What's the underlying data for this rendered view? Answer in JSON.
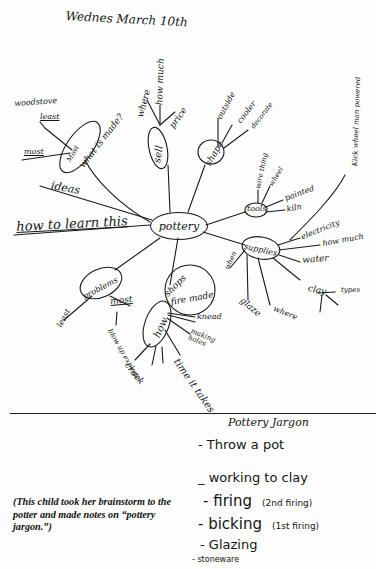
{
  "header": {
    "date": "Wednes March 10th"
  },
  "mindmap": {
    "center": "pottery",
    "branches": {
      "what_is_made": {
        "label": "what is made?",
        "sub_label": "Most",
        "children": [
          "woodstove",
          "least",
          "most"
        ]
      },
      "ideas": {
        "label": "ideas"
      },
      "how_to_learn": {
        "label": "how to learn this"
      },
      "sell": {
        "label": "sell",
        "children": [
          "where",
          "how much",
          "price"
        ]
      },
      "shape": {
        "label": "shape",
        "children": [
          "outside",
          "cooler",
          "decorate"
        ]
      },
      "tools": {
        "label": "tools",
        "children": [
          "wire thing",
          "wheel",
          "painted",
          "kiln"
        ]
      },
      "supplies": {
        "label": "supplies",
        "side": "when",
        "children": [
          "electricity",
          "how much",
          "water",
          "clay",
          "glaze",
          "where"
        ],
        "clay_child": "types",
        "electricity_note": "Kick wheel man powered"
      },
      "problems": {
        "label": "problems",
        "children": [
          "least",
          "most"
        ],
        "most_child": "blow up explode"
      },
      "how": {
        "label": "how",
        "shops_label": "shops",
        "fire_label": "fire made",
        "children": [
          "knead",
          "making holes",
          "crack",
          "time it takes"
        ]
      }
    }
  },
  "jargon": {
    "title": "Pottery Jargon",
    "items": [
      {
        "text": "- Throw a pot",
        "note": ""
      },
      {
        "text": "_ working to clay",
        "note": ""
      },
      {
        "text": "- firing",
        "note": "(2nd firing)"
      },
      {
        "text": "- bicking",
        "note": "(1st firing)"
      },
      {
        "text": "- Glazing",
        "note": ""
      },
      {
        "text": "- stoneware",
        "note": ""
      }
    ]
  },
  "caption": "(This child took her brainstorm to the potter and made notes on “pottery jargon.”)"
}
